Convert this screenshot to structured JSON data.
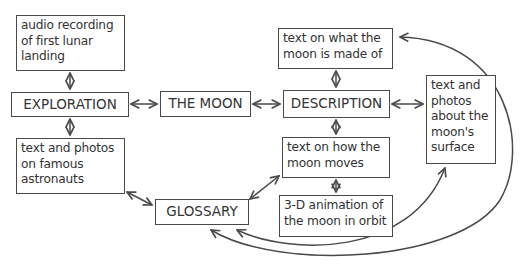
{
  "diagram": {
    "type": "web-page-site-map",
    "nodes": {
      "audio": {
        "label": "audio recording of first lunar landing",
        "lines": [
          "audio recording",
          "of first lunar",
          "landing"
        ]
      },
      "exploration": {
        "label": "EXPLORATION"
      },
      "moon": {
        "label": "THE MOON"
      },
      "description": {
        "label": "DESCRIPTION"
      },
      "made_of": {
        "label": "text on what the moon is made of",
        "lines": [
          "text on what the",
          "moon is made of"
        ]
      },
      "surface": {
        "label": "text and photos about the moon's surface",
        "lines": [
          "text and",
          "photos",
          "about the",
          "moon's",
          "surface"
        ]
      },
      "astronauts": {
        "label": "text and photos on famous astronauts",
        "lines": [
          "text and photos",
          "on famous",
          "astronauts"
        ]
      },
      "glossary": {
        "label": "GLOSSARY"
      },
      "moves": {
        "label": "text on how the moon moves",
        "lines": [
          "text on how the",
          "moon moves"
        ]
      },
      "animation": {
        "label": "3-D animation of the moon in orbit",
        "lines": [
          "3-D animation of",
          "the moon in orbit"
        ]
      }
    },
    "edges": [
      {
        "from": "audio",
        "to": "exploration",
        "direction": "both"
      },
      {
        "from": "exploration",
        "to": "moon",
        "direction": "both"
      },
      {
        "from": "moon",
        "to": "description",
        "direction": "both"
      },
      {
        "from": "exploration",
        "to": "astronauts",
        "direction": "both"
      },
      {
        "from": "made_of",
        "to": "description",
        "direction": "both"
      },
      {
        "from": "description",
        "to": "surface",
        "direction": "both"
      },
      {
        "from": "description",
        "to": "moves",
        "direction": "both"
      },
      {
        "from": "moves",
        "to": "animation",
        "direction": "both"
      },
      {
        "from": "astronauts",
        "to": "glossary",
        "direction": "both"
      },
      {
        "from": "glossary",
        "to": "moves",
        "direction": "both"
      },
      {
        "from": "glossary",
        "to": "surface",
        "direction": "both"
      },
      {
        "from": "glossary",
        "to": "made_of",
        "direction": "both"
      }
    ],
    "colors": {
      "line": "#4a4a4a",
      "background": "#ffffff",
      "text": "#333333"
    }
  }
}
